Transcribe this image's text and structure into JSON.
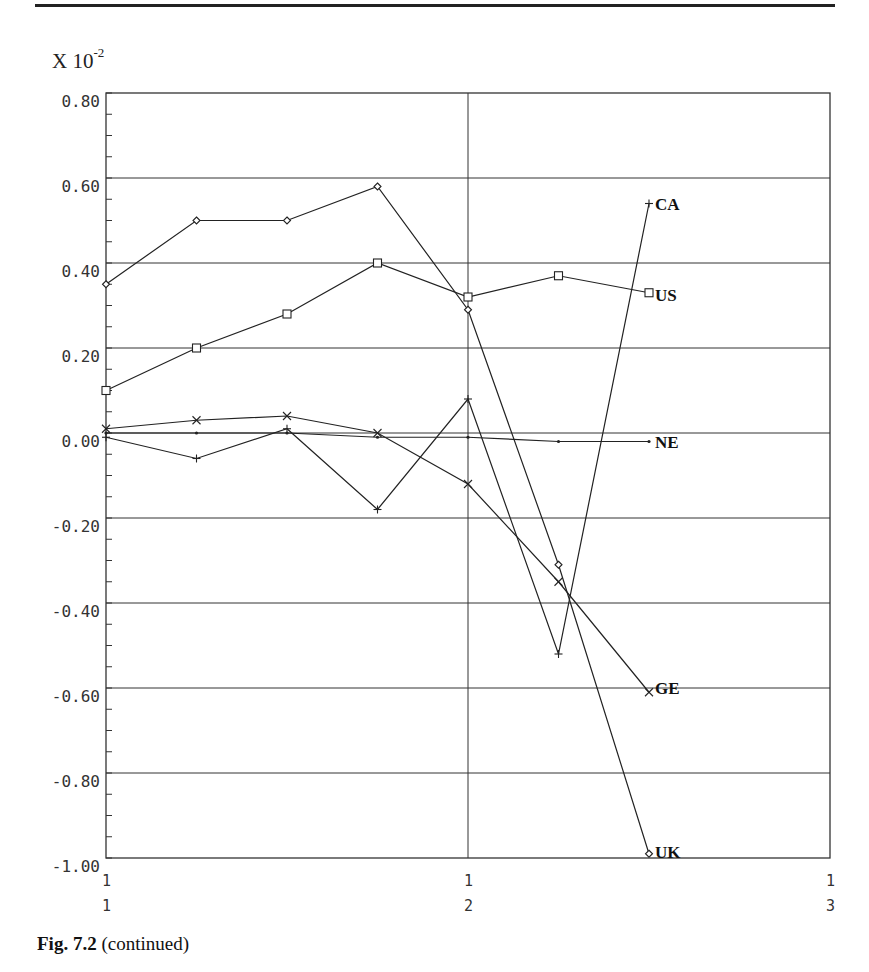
{
  "figure": {
    "caption_bold": "Fig. 7.2",
    "caption_rest": " (continued)",
    "scale_prefix": "X 10",
    "scale_exp": "-2"
  },
  "chart_data": {
    "type": "line",
    "title": "",
    "xlabel": "",
    "ylabel": "X 10^-2",
    "y_multiplier": "10^-2",
    "ylim": [
      -1.0,
      0.8
    ],
    "yticks": [
      0.8,
      0.6,
      0.4,
      0.2,
      0.0,
      -0.2,
      -0.4,
      -0.6,
      -0.8,
      -1.0
    ],
    "ytick_labels": [
      "0.80",
      "0.60",
      "0.40",
      "0.20",
      "0.00",
      "-0.20",
      "-0.40",
      "-0.60",
      "-0.80",
      "-1.00"
    ],
    "x": [
      1,
      2,
      3,
      4,
      5,
      6,
      7
    ],
    "xlim": [
      1,
      9
    ],
    "xtick_positions": [
      1,
      5,
      9
    ],
    "xtick_labels": [
      [
        "1",
        "1"
      ],
      [
        "1",
        "2"
      ],
      [
        "1",
        "3"
      ]
    ],
    "grid": "horizontal gridlines at major y ticks; vertical gridline at x tick 1/2",
    "legend": "inline series labels at right end of each line",
    "series": [
      {
        "name": "CA",
        "marker": "plus",
        "values": [
          -0.01,
          -0.06,
          0.01,
          -0.18,
          0.08,
          -0.52,
          0.54
        ]
      },
      {
        "name": "US",
        "marker": "square",
        "values": [
          0.1,
          0.2,
          0.28,
          0.4,
          0.32,
          0.37,
          0.33
        ]
      },
      {
        "name": "NE",
        "marker": "dot",
        "values": [
          0.0,
          0.0,
          0.0,
          -0.01,
          -0.01,
          -0.02,
          -0.02
        ]
      },
      {
        "name": "GE",
        "marker": "x",
        "values": [
          0.01,
          0.03,
          0.04,
          0.0,
          -0.12,
          -0.35,
          -0.61
        ]
      },
      {
        "name": "UK",
        "marker": "diamond",
        "values": [
          0.35,
          0.5,
          0.5,
          0.58,
          0.29,
          -0.31,
          -0.99
        ]
      }
    ]
  }
}
